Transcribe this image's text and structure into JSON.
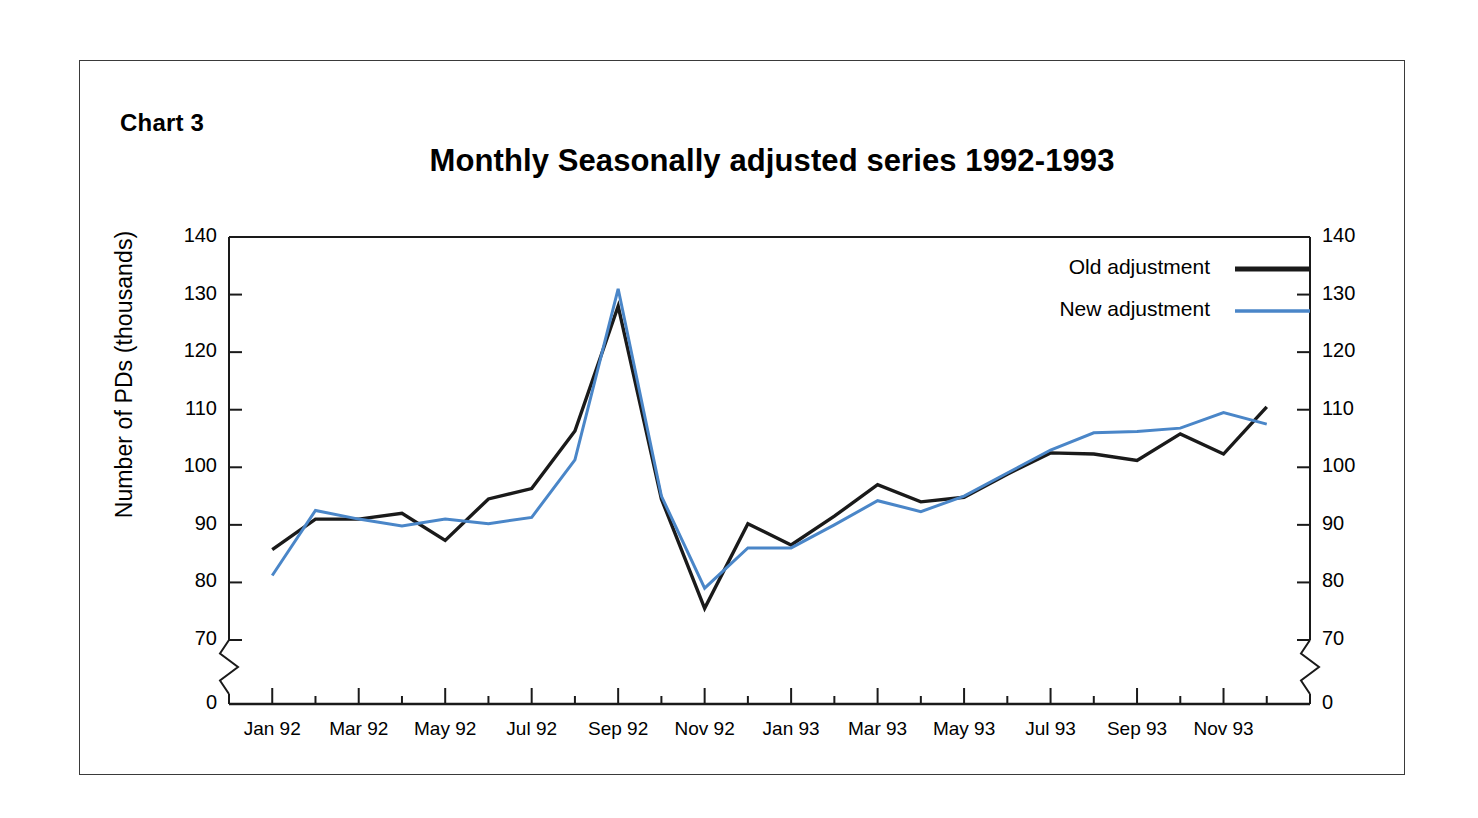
{
  "figure": {
    "chart_number_label": "Chart 3",
    "title": "Monthly Seasonally adjusted series 1992-1993"
  },
  "axes": {
    "y_axis_title": "Number of PDs (thousands)",
    "y_ticks": [
      "140",
      "130",
      "120",
      "110",
      "100",
      "90",
      "80",
      "70",
      "0"
    ],
    "y_axis_break": true,
    "x_ticks": [
      "Jan 92",
      "Mar 92",
      "May 92",
      "Jul 92",
      "Sep 92",
      "Nov 92",
      "Jan 93",
      "Mar 93",
      "May 93",
      "Jul 93",
      "Sep 93",
      "Nov 93"
    ]
  },
  "legend": {
    "position": "top-right",
    "entries": [
      {
        "label": "Old adjustment",
        "color": "#1a1a1a"
      },
      {
        "label": "New adjustment",
        "color": "#4a86c8"
      }
    ]
  },
  "colors": {
    "old_adjustment": "#1a1a1a",
    "new_adjustment": "#4a86c8",
    "axis": "#1a1a1a",
    "frame": "#3a3a3a",
    "background": "#ffffff"
  },
  "chart_data": {
    "type": "line",
    "title": "Monthly Seasonally adjusted series 1992-1993",
    "xlabel": "",
    "ylabel": "Number of PDs (thousands)",
    "ylim": [
      70,
      140
    ],
    "y_axis_has_break_to_zero": true,
    "ytick_values": [
      70,
      80,
      90,
      100,
      110,
      120,
      130,
      140
    ],
    "grid": false,
    "legend_position": "top-right",
    "x": [
      "Jan 92",
      "Feb 92",
      "Mar 92",
      "Apr 92",
      "May 92",
      "Jun 92",
      "Jul 92",
      "Aug 92",
      "Sep 92",
      "Oct 92",
      "Nov 92",
      "Dec 92",
      "Jan 93",
      "Feb 93",
      "Mar 93",
      "Apr 93",
      "May 93",
      "Jun 93",
      "Jul 93",
      "Aug 93",
      "Sep 93",
      "Oct 93",
      "Nov 93",
      "Dec 93"
    ],
    "series": [
      {
        "name": "Old adjustment",
        "color": "#1a1a1a",
        "values": [
          85.7,
          91.0,
          91.0,
          92.0,
          87.3,
          94.5,
          96.3,
          106.3,
          128.0,
          94.5,
          75.5,
          90.2,
          86.5,
          91.5,
          97.0,
          94.0,
          94.8,
          98.8,
          102.5,
          102.3,
          101.2,
          105.8,
          102.3,
          110.5
        ]
      },
      {
        "name": "New adjustment",
        "color": "#4a86c8",
        "values": [
          81.2,
          92.5,
          91.0,
          89.8,
          91.0,
          90.2,
          91.3,
          101.3,
          131.0,
          95.0,
          79.0,
          86.0,
          86.0,
          90.0,
          94.2,
          92.3,
          95.0,
          99.0,
          103.0,
          106.0,
          106.2,
          106.8,
          109.5,
          107.5
        ]
      }
    ]
  }
}
